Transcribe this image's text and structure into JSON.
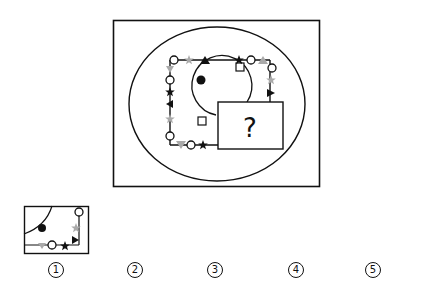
{
  "puzzle": {
    "question_mark": "?",
    "description": "Circle containing a square path with symbols and an inner arc; lower-right region hidden by a box with a question mark",
    "colors": {
      "black": "#111111",
      "gray": "#aaaaaa",
      "white": "#ffffff"
    },
    "path_symbols_clockwise_from_top_left": [
      "circle",
      "gray-star",
      "black-triangle-up",
      "black-star",
      "circle",
      "gray-triangle",
      "circle",
      "gray-star",
      "black-triangle-right",
      "?",
      "?",
      "?",
      "black-star",
      "circle",
      "gray-triangle-down",
      "circle",
      "gray-star",
      "black-triangle-left",
      "black-star",
      "circle",
      "gray-triangle"
    ],
    "inner_arc_symbols": [
      "black-dot",
      "square",
      "square"
    ]
  },
  "options": [
    {
      "label": "1",
      "glyph": "①"
    },
    {
      "label": "2",
      "glyph": "②"
    },
    {
      "label": "3",
      "glyph": "③"
    },
    {
      "label": "4",
      "glyph": "④"
    },
    {
      "label": "5",
      "glyph": "⑤"
    }
  ]
}
